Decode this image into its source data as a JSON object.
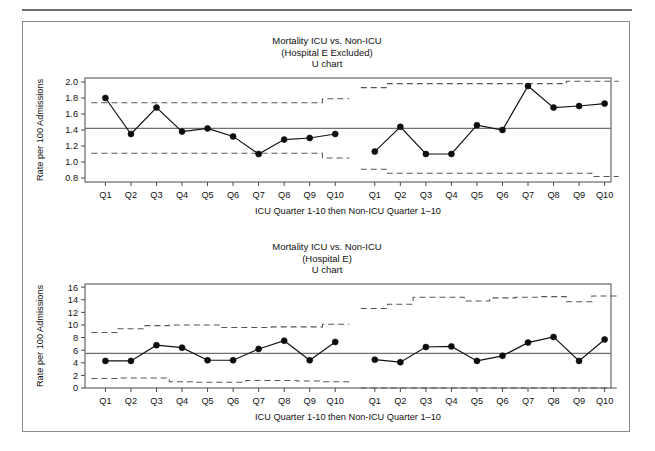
{
  "figure": {
    "panels": [
      {
        "id": "panel-top",
        "title_line1": "Mortality ICU vs. Non-ICU",
        "title_line2": "(Hospital E Excluded)",
        "title_line3": "U chart",
        "ylabel": "Rate per 100 Admissions",
        "xlabel": "ICU Quarter 1-10 then Non-ICU Quarter 1–10"
      },
      {
        "id": "panel-bottom",
        "title_line1": "Mortality ICU vs. Non-ICU",
        "title_line2": "(Hospital E)",
        "title_line3": "U chart",
        "ylabel": "Rate per 100 Admissions",
        "xlabel": "ICU Quarter 1-10 then Non-ICU Quarter 1–10"
      }
    ]
  },
  "chart_data": [
    {
      "type": "line",
      "title": "Mortality ICU vs. Non-ICU (Hospital E Excluded) U chart",
      "xlabel": "ICU Quarter 1-10 then Non-ICU Quarter 1–10",
      "ylabel": "Rate per 100 Admissions",
      "ylim": [
        0.75,
        2.05
      ],
      "yticks": [
        0.8,
        1.0,
        1.2,
        1.4,
        1.6,
        1.8,
        2.0
      ],
      "ytick_labels": [
        "0.8",
        "1.0",
        "1.2",
        "1.4",
        "1.6",
        "1.8",
        "2.0"
      ],
      "grid": false,
      "legend": "none",
      "categories": [
        "Q1",
        "Q2",
        "Q3",
        "Q4",
        "Q5",
        "Q6",
        "Q7",
        "Q8",
        "Q9",
        "Q10",
        "Q1",
        "Q2",
        "Q3",
        "Q4",
        "Q5",
        "Q6",
        "Q7",
        "Q8",
        "Q9",
        "Q10"
      ],
      "series": [
        {
          "name": "ICU",
          "group": "icu",
          "x_labels": [
            "Q1",
            "Q2",
            "Q3",
            "Q4",
            "Q5",
            "Q6",
            "Q7",
            "Q8",
            "Q9",
            "Q10"
          ],
          "values": [
            1.8,
            1.35,
            1.68,
            1.38,
            1.42,
            1.32,
            1.1,
            1.28,
            1.3,
            1.35
          ],
          "center_line": 1.42,
          "upper_control_limit": [
            1.74,
            1.74,
            1.74,
            1.74,
            1.74,
            1.74,
            1.74,
            1.74,
            1.74,
            1.79
          ],
          "lower_control_limit": [
            1.11,
            1.11,
            1.11,
            1.11,
            1.11,
            1.11,
            1.11,
            1.11,
            1.11,
            1.05
          ]
        },
        {
          "name": "Non-ICU",
          "group": "non-icu",
          "x_labels": [
            "Q1",
            "Q2",
            "Q3",
            "Q4",
            "Q5",
            "Q6",
            "Q7",
            "Q8",
            "Q9",
            "Q10"
          ],
          "values": [
            1.13,
            1.44,
            1.1,
            1.1,
            1.46,
            1.4,
            1.95,
            1.68,
            1.7,
            1.73
          ],
          "center_line": 1.42,
          "upper_control_limit": [
            1.93,
            1.98,
            1.98,
            1.98,
            1.98,
            1.98,
            1.98,
            1.98,
            2.01,
            2.01
          ],
          "lower_control_limit": [
            0.91,
            0.86,
            0.86,
            0.86,
            0.86,
            0.86,
            0.86,
            0.86,
            0.86,
            0.82
          ]
        }
      ]
    },
    {
      "type": "line",
      "title": "Mortality ICU vs. Non-ICU (Hospital E) U chart",
      "xlabel": "ICU Quarter 1-10 then Non-ICU Quarter 1–10",
      "ylabel": "Rate per 100 Admissions",
      "ylim": [
        0,
        16.5
      ],
      "yticks": [
        0,
        2,
        4,
        6,
        8,
        10,
        12,
        14,
        16
      ],
      "ytick_labels": [
        "0",
        "2",
        "4",
        "6",
        "8",
        "10",
        "12",
        "14",
        "16"
      ],
      "grid": false,
      "legend": "none",
      "categories": [
        "Q1",
        "Q2",
        "Q3",
        "Q4",
        "Q5",
        "Q6",
        "Q7",
        "Q8",
        "Q9",
        "Q10",
        "Q1",
        "Q2",
        "Q3",
        "Q4",
        "Q5",
        "Q6",
        "Q7",
        "Q8",
        "Q9",
        "Q10"
      ],
      "series": [
        {
          "name": "ICU",
          "group": "icu",
          "x_labels": [
            "Q1",
            "Q2",
            "Q3",
            "Q4",
            "Q5",
            "Q6",
            "Q7",
            "Q8",
            "Q9",
            "Q10"
          ],
          "values": [
            4.3,
            4.3,
            6.8,
            6.4,
            4.4,
            4.4,
            6.2,
            7.5,
            4.4,
            7.3
          ],
          "center_line": 5.5,
          "upper_control_limit": [
            8.8,
            9.4,
            9.9,
            10.0,
            10.0,
            9.6,
            9.6,
            9.7,
            9.7,
            10.1
          ],
          "lower_control_limit": [
            1.5,
            1.6,
            1.6,
            1.0,
            0.9,
            0.9,
            1.2,
            1.2,
            1.1,
            1.0
          ]
        },
        {
          "name": "Non-ICU",
          "group": "non-icu",
          "x_labels": [
            "Q1",
            "Q2",
            "Q3",
            "Q4",
            "Q5",
            "Q6",
            "Q7",
            "Q8",
            "Q9",
            "Q10"
          ],
          "values": [
            4.5,
            4.1,
            6.5,
            6.6,
            4.3,
            5.1,
            7.2,
            8.1,
            4.3,
            7.7
          ],
          "center_line": 5.5,
          "upper_control_limit": [
            12.6,
            13.3,
            14.4,
            14.4,
            13.8,
            14.3,
            14.4,
            14.5,
            13.7,
            14.6
          ],
          "lower_control_limit": [
            0,
            0,
            0,
            0,
            0,
            0,
            0,
            0,
            0,
            0
          ]
        }
      ]
    }
  ]
}
